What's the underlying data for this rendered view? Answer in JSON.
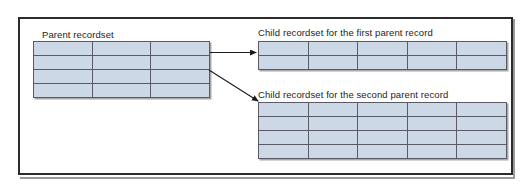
{
  "diagram": {
    "title_visible": false,
    "frame": {
      "name": "outer-figure-frame"
    },
    "colors": {
      "cell_fill": "#ccd8e6",
      "cell_border": "#5a5a66",
      "frame_border": "#2b2b2b",
      "text": "#1c1c1c",
      "arrow": "#1c1c1c"
    },
    "nodes": [
      {
        "id": "parent",
        "label": "Parent recordset",
        "label_position": "above-left",
        "columns": 3,
        "rows": 4,
        "cells": [
          [
            "",
            "",
            ""
          ],
          [
            "",
            "",
            ""
          ],
          [
            "",
            "",
            ""
          ],
          [
            "",
            "",
            ""
          ]
        ]
      },
      {
        "id": "child1",
        "label": "Child recordset for the first parent record",
        "label_position": "above-left",
        "columns": 5,
        "rows": 2,
        "cells": [
          [
            "",
            "",
            "",
            "",
            ""
          ],
          [
            "",
            "",
            "",
            "",
            ""
          ]
        ]
      },
      {
        "id": "child2",
        "label": "Child recordset for the second parent record",
        "label_position": "above-left",
        "columns": 5,
        "rows": 4,
        "cells": [
          [
            "",
            "",
            "",
            "",
            ""
          ],
          [
            "",
            "",
            "",
            "",
            ""
          ],
          [
            "",
            "",
            "",
            "",
            ""
          ],
          [
            "",
            "",
            "",
            "",
            ""
          ]
        ]
      }
    ],
    "connectors": [
      {
        "id": "parent-to-child1",
        "from": "parent",
        "to": "child1",
        "style": "straight-arrow",
        "label": ""
      },
      {
        "id": "parent-to-child2",
        "from": "parent",
        "to": "child2",
        "style": "straight-arrow",
        "label": ""
      }
    ]
  }
}
